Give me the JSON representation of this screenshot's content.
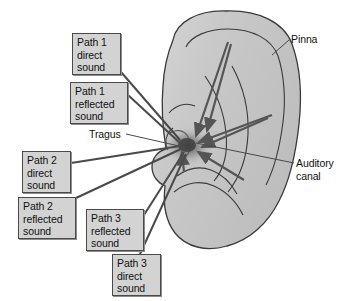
{
  "figure": {
    "background_color": "#ffffff",
    "ear_fill_color": "#c6c6c6",
    "ear_outline_color": "#3a3a3a",
    "box_fill_color": "#d3d3d3",
    "box_border_color": "#4a4a4a",
    "leader_line_color": "#4a4a4a",
    "arrow_color": "#555555"
  },
  "anatomy_labels": [
    {
      "id": "pinna",
      "text": "Pinna",
      "boxed": false,
      "x": 291,
      "y": 33
    },
    {
      "id": "tragus",
      "text": "Tragus",
      "boxed": false,
      "x": 89,
      "y": 128
    },
    {
      "id": "auditory-canal",
      "text": "Auditory\ncanal",
      "boxed": false,
      "x": 296,
      "y": 157
    }
  ],
  "path_labels": [
    {
      "id": "path-1-direct",
      "text": "Path 1\ndirect\nsound",
      "boxed": true,
      "x": 72,
      "y": 33,
      "w": 49,
      "h": 42
    },
    {
      "id": "path-1-reflected",
      "text": "Path 1\nreflected\nsound",
      "boxed": true,
      "x": 70,
      "y": 82,
      "w": 58,
      "h": 42
    },
    {
      "id": "path-2-direct",
      "text": "Path 2\ndirect\nsound",
      "boxed": true,
      "x": 22,
      "y": 151,
      "w": 49,
      "h": 42
    },
    {
      "id": "path-2-reflected",
      "text": "Path 2\nreflected\nsound",
      "boxed": true,
      "x": 18,
      "y": 197,
      "w": 58,
      "h": 42
    },
    {
      "id": "path-3-reflected",
      "text": "Path 3\nreflected\nsound",
      "boxed": true,
      "x": 86,
      "y": 209,
      "w": 58,
      "h": 42
    },
    {
      "id": "path-3-direct",
      "text": "Path 3\ndirect\nsound",
      "boxed": true,
      "x": 112,
      "y": 254,
      "w": 49,
      "h": 42
    }
  ],
  "focus_point": {
    "label": "ear-canal-entrance",
    "x": 186,
    "y": 146
  }
}
